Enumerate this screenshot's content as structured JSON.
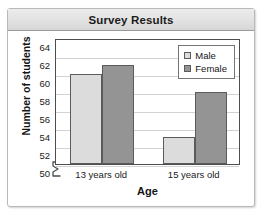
{
  "chart_data": {
    "type": "bar",
    "title": "Survey Results",
    "xlabel": "Age",
    "ylabel": "Number of students",
    "categories": [
      "13 years old",
      "15 years old"
    ],
    "series": [
      {
        "name": "Male",
        "values": [
          60,
          53
        ],
        "color": "#dcdcdc"
      },
      {
        "name": "Female",
        "values": [
          61,
          58
        ],
        "color": "#949494"
      }
    ],
    "ylim": [
      50,
      64
    ],
    "ytick_step": 2,
    "yticks": [
      64,
      62,
      60,
      58,
      56,
      54,
      52,
      50
    ],
    "grid": true,
    "axis_break": true,
    "legend_position": "top-right",
    "bar_border_color": "#5b5b5b",
    "plot_border_color": "#4d4d4d",
    "gridline_color": "#d2d2d2"
  },
  "figure": {
    "title_band_color": "#e2e2e2",
    "frame_color": "#b9b9b9"
  }
}
